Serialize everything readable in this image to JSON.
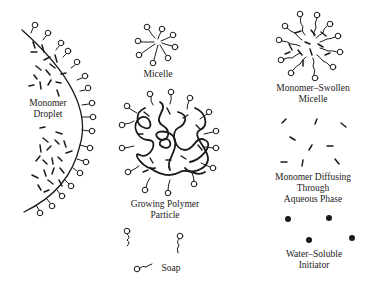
{
  "diagram": {
    "type": "emulsion-polymerization-schematic",
    "labels": {
      "monomer_droplet": [
        "Monomer",
        "Droplet"
      ],
      "micelle": [
        "Micelle"
      ],
      "growing_polymer_particle": [
        "Growing Polymer",
        "Particle"
      ],
      "soap": [
        "Soap"
      ],
      "monomer_swollen_micelle": [
        "Monomer–Swollen",
        "Micelle"
      ],
      "monomer_diffusing": [
        "Monomer Diffusing",
        "Through",
        "Aqueous Phase"
      ],
      "water_soluble_initiator": [
        "Water–Soluble",
        "Initiator"
      ]
    },
    "colors": {
      "ink": "#1a1a1a",
      "background": "#ffffff"
    }
  }
}
